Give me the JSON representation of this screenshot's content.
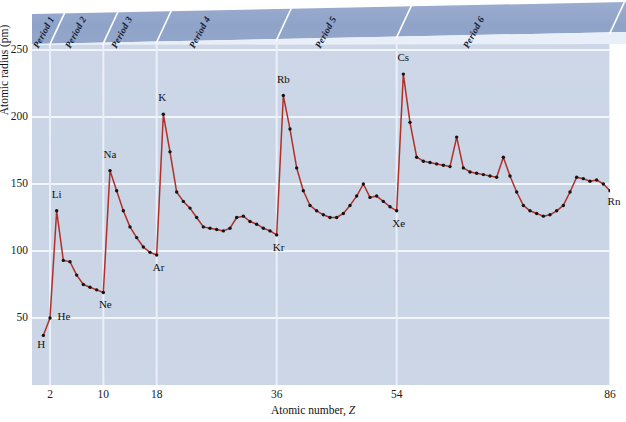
{
  "figure": {
    "axis": {
      "ylabel": "Atomic radius (pm)",
      "xlabel_pre": "Atomic number, ",
      "xlabel_italic": "Z",
      "yticks": [
        "250",
        "200",
        "150",
        "100",
        "50"
      ],
      "xticks": [
        "2",
        "10",
        "18",
        "36",
        "54",
        "86"
      ]
    },
    "periods": [
      {
        "label": "Period 1"
      },
      {
        "label": "Period 2"
      },
      {
        "label": "Period 3"
      },
      {
        "label": "Period 4"
      },
      {
        "label": "Period 5"
      },
      {
        "label": "Period 6"
      }
    ],
    "colors": {
      "line": "#b03028",
      "marker": "#141414",
      "plot_background": "#ccd6e6",
      "banner": "#8fa3c8",
      "banner_light": "#aebbd7",
      "gridline": "#f2f6fb",
      "text": "#111111"
    },
    "annotations": [
      {
        "label": "H",
        "z": 1
      },
      {
        "label": "He",
        "z": 2
      },
      {
        "label": "Li",
        "z": 3
      },
      {
        "label": "Ne",
        "z": 10
      },
      {
        "label": "Na",
        "z": 11
      },
      {
        "label": "Ar",
        "z": 18
      },
      {
        "label": "K",
        "z": 19
      },
      {
        "label": "Kr",
        "z": 36
      },
      {
        "label": "Rb",
        "z": 37
      },
      {
        "label": "Xe",
        "z": 54
      },
      {
        "label": "Cs",
        "z": 55
      },
      {
        "label": "Rn",
        "z": 86
      }
    ]
  },
  "chart_data": {
    "type": "line",
    "title": "",
    "xlabel": "Atomic number, Z",
    "ylabel": "Atomic radius (pm)",
    "xlim": [
      1,
      86
    ],
    "ylim": [
      0,
      260
    ],
    "yticks": [
      50,
      100,
      150,
      200,
      250
    ],
    "xticks": [
      2,
      10,
      18,
      36,
      54,
      86
    ],
    "grid": true,
    "legend": "none",
    "series": [
      {
        "name": "Atomic radius",
        "x": [
          1,
          2,
          3,
          4,
          5,
          6,
          7,
          8,
          9,
          10,
          11,
          12,
          13,
          14,
          15,
          16,
          17,
          18,
          19,
          20,
          21,
          22,
          23,
          24,
          25,
          26,
          27,
          28,
          29,
          30,
          31,
          32,
          33,
          34,
          35,
          36,
          37,
          38,
          39,
          40,
          41,
          42,
          43,
          44,
          45,
          46,
          47,
          48,
          49,
          50,
          51,
          52,
          53,
          54,
          55,
          56,
          57,
          58,
          59,
          60,
          61,
          62,
          63,
          64,
          65,
          66,
          67,
          68,
          69,
          70,
          71,
          72,
          73,
          74,
          75,
          76,
          77,
          78,
          79,
          80,
          81,
          82,
          83,
          84,
          85,
          86
        ],
        "y": [
          37,
          50,
          130,
          93,
          92,
          82,
          75,
          73,
          71,
          69,
          160,
          145,
          130,
          118,
          110,
          103,
          99,
          97,
          202,
          174,
          144,
          137,
          132,
          125,
          118,
          117,
          116,
          115,
          117,
          125,
          126,
          122,
          120,
          117,
          115,
          112,
          216,
          191,
          162,
          145,
          134,
          130,
          127,
          125,
          125,
          128,
          134,
          141,
          150,
          140,
          141,
          137,
          133,
          130,
          232,
          196,
          170,
          167,
          166,
          165,
          164,
          163,
          185,
          162,
          159,
          158,
          157,
          156,
          155,
          170,
          156,
          144,
          134,
          130,
          128,
          126,
          127,
          130,
          134,
          144,
          155,
          154,
          152,
          153,
          150,
          145
        ]
      }
    ],
    "annotated_points": [
      {
        "label": "H",
        "x": 1,
        "y": 37
      },
      {
        "label": "He",
        "x": 2,
        "y": 50
      },
      {
        "label": "Li",
        "x": 3,
        "y": 130
      },
      {
        "label": "Ne",
        "x": 10,
        "y": 69
      },
      {
        "label": "Na",
        "x": 11,
        "y": 160
      },
      {
        "label": "Ar",
        "x": 18,
        "y": 97
      },
      {
        "label": "K",
        "x": 19,
        "y": 202
      },
      {
        "label": "Kr",
        "x": 36,
        "y": 112
      },
      {
        "label": "Rb",
        "x": 37,
        "y": 216
      },
      {
        "label": "Xe",
        "x": 54,
        "y": 130
      },
      {
        "label": "Cs",
        "x": 55,
        "y": 232
      },
      {
        "label": "Rn",
        "x": 86,
        "y": 145
      }
    ],
    "period_bands": [
      {
        "label": "Period 1",
        "z_start": 1,
        "z_end": 2
      },
      {
        "label": "Period 2",
        "z_start": 3,
        "z_end": 10
      },
      {
        "label": "Period 3",
        "z_start": 11,
        "z_end": 18
      },
      {
        "label": "Period 4",
        "z_start": 19,
        "z_end": 36
      },
      {
        "label": "Period 5",
        "z_start": 37,
        "z_end": 54
      },
      {
        "label": "Period 6",
        "z_start": 55,
        "z_end": 86
      }
    ]
  }
}
